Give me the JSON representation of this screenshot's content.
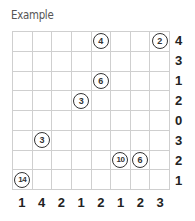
{
  "title": "Example",
  "grid": {
    "rows": 8,
    "cols": 8,
    "circles": [
      {
        "row": 0,
        "col": 4,
        "value": "4"
      },
      {
        "row": 0,
        "col": 7,
        "value": "2"
      },
      {
        "row": 2,
        "col": 4,
        "value": "6"
      },
      {
        "row": 3,
        "col": 3,
        "value": "3"
      },
      {
        "row": 5,
        "col": 1,
        "value": "3"
      },
      {
        "row": 6,
        "col": 5,
        "value": "10"
      },
      {
        "row": 6,
        "col": 6,
        "value": "6"
      },
      {
        "row": 7,
        "col": 0,
        "value": "14"
      }
    ]
  },
  "row_clues": [
    "4",
    "3",
    "1",
    "2",
    "0",
    "3",
    "2",
    "1"
  ],
  "col_clues": [
    "1",
    "4",
    "2",
    "1",
    "2",
    "1",
    "2",
    "3"
  ]
}
